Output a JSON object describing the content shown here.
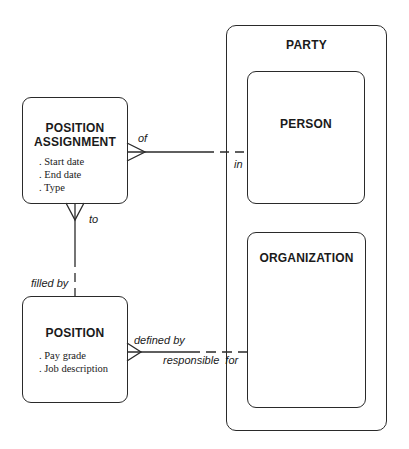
{
  "entities": {
    "position_assignment": {
      "title_line1": "POSITION",
      "title_line2": "ASSIGNMENT",
      "attributes": [
        "Start date",
        "End date",
        "Type"
      ]
    },
    "position": {
      "title": "POSITION",
      "attributes": [
        "Pay grade",
        "Job description"
      ]
    },
    "party": {
      "title": "PARTY",
      "subtypes": {
        "person": {
          "title": "PERSON"
        },
        "organization": {
          "title": "ORGANIZATION"
        }
      }
    }
  },
  "relationships": {
    "assignment_person": {
      "from_label": "of",
      "to_label": "in"
    },
    "assignment_position": {
      "from_label": "to",
      "to_label": "filled by"
    },
    "position_organization": {
      "from_label": "defined by",
      "to_label": "responsible  for"
    }
  },
  "colors": {
    "line": "#2a2a2a",
    "background": "#ffffff"
  }
}
